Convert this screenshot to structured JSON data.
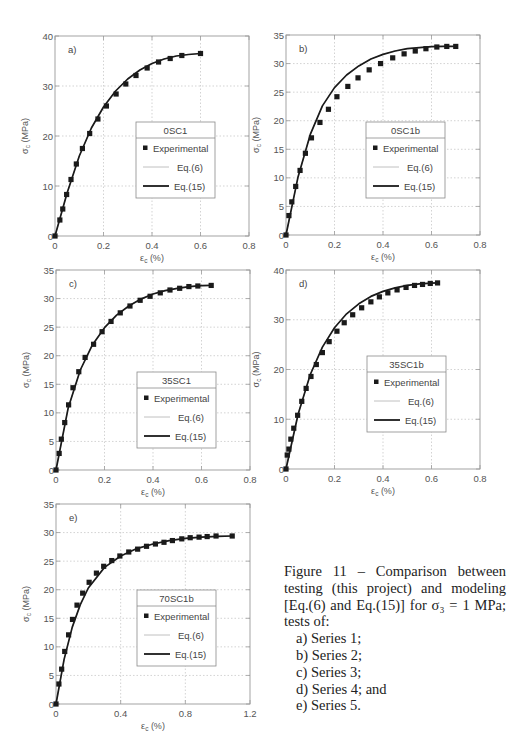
{
  "chart_data": [
    {
      "type": "scatter",
      "panel_label": "a)",
      "legend_title": "0SC1",
      "legend": [
        "Experimental",
        "Eq.(6)",
        "Eq.(15)"
      ],
      "xlabel": "εc (%)",
      "ylabel": "σc (MPa)",
      "xlim": [
        0,
        0.8
      ],
      "ylim": [
        0,
        40
      ],
      "xticks": [
        0,
        0.2,
        0.4,
        0.6,
        0.8
      ],
      "yticks": [
        0,
        10,
        20,
        30,
        40
      ],
      "grid": true,
      "experimental": {
        "x": [
          0,
          0.02,
          0.032,
          0.048,
          0.066,
          0.088,
          0.113,
          0.143,
          0.177,
          0.212,
          0.252,
          0.292,
          0.334,
          0.38,
          0.427,
          0.475,
          0.523,
          0.6
        ],
        "y": [
          0,
          3.2,
          5.4,
          8.3,
          11.3,
          14.4,
          17.5,
          20.5,
          23.4,
          26.0,
          28.4,
          30.4,
          32.1,
          33.6,
          34.8,
          35.5,
          36.1,
          36.5
        ]
      },
      "series": [
        {
          "name": "Eq.(6)",
          "x": [
            0,
            0.05,
            0.1,
            0.15,
            0.2,
            0.25,
            0.3,
            0.35,
            0.4,
            0.45,
            0.5,
            0.55,
            0.6
          ],
          "y": [
            0,
            8.6,
            16.0,
            21.6,
            25.8,
            29.0,
            31.4,
            33.2,
            34.5,
            35.4,
            36.0,
            36.3,
            36.5
          ]
        },
        {
          "name": "Eq.(15)",
          "x": [
            0,
            0.05,
            0.1,
            0.15,
            0.2,
            0.25,
            0.3,
            0.35,
            0.4,
            0.45,
            0.5,
            0.55,
            0.6
          ],
          "y": [
            0,
            8.6,
            16.0,
            21.6,
            25.8,
            29.0,
            31.4,
            33.2,
            34.5,
            35.4,
            36.0,
            36.3,
            36.5
          ]
        }
      ]
    },
    {
      "type": "scatter",
      "panel_label": "b)",
      "legend_title": "0SC1b",
      "legend": [
        "Experimental",
        "Eq.(6)",
        "Eq.(15)"
      ],
      "xlabel": "εc (%)",
      "ylabel": "σc (MPa)",
      "xlim": [
        0,
        0.8
      ],
      "ylim": [
        0,
        35
      ],
      "xticks": [
        0,
        0.2,
        0.4,
        0.6,
        0.8
      ],
      "yticks": [
        0,
        5,
        10,
        15,
        20,
        25,
        30,
        35
      ],
      "grid": true,
      "experimental": {
        "x": [
          0,
          0.012,
          0.024,
          0.04,
          0.058,
          0.08,
          0.105,
          0.14,
          0.175,
          0.21,
          0.255,
          0.297,
          0.343,
          0.39,
          0.44,
          0.487,
          0.533,
          0.577,
          0.622,
          0.663,
          0.7
        ],
        "y": [
          0,
          3.4,
          5.8,
          8.5,
          11.3,
          14.3,
          17.0,
          19.7,
          22.0,
          24.2,
          26.0,
          27.5,
          28.9,
          30.0,
          31.0,
          31.7,
          32.2,
          32.6,
          32.9,
          33.0,
          33.0
        ]
      },
      "series": [
        {
          "name": "Eq.(6)",
          "x": [
            0,
            0.05,
            0.1,
            0.15,
            0.2,
            0.25,
            0.3,
            0.35,
            0.4,
            0.45,
            0.5,
            0.55,
            0.6,
            0.65,
            0.7
          ],
          "y": [
            0,
            10.2,
            17.6,
            22.6,
            25.8,
            28.0,
            29.6,
            30.8,
            31.6,
            32.2,
            32.6,
            32.8,
            32.95,
            33.0,
            33.0
          ]
        },
        {
          "name": "Eq.(15)",
          "x": [
            0,
            0.05,
            0.1,
            0.15,
            0.2,
            0.25,
            0.3,
            0.35,
            0.4,
            0.45,
            0.5,
            0.55,
            0.6,
            0.65,
            0.7
          ],
          "y": [
            0,
            10.2,
            17.6,
            22.6,
            25.8,
            28.0,
            29.6,
            30.8,
            31.6,
            32.2,
            32.6,
            32.8,
            32.95,
            33.0,
            33.0
          ]
        }
      ]
    },
    {
      "type": "scatter",
      "panel_label": "c)",
      "legend_title": "35SC1",
      "legend": [
        "Experimental",
        "Eq.(6)",
        "Eq.(15)"
      ],
      "xlabel": "εc (%)",
      "ylabel": "σc (MPa)",
      "xlim": [
        0,
        0.8
      ],
      "ylim": [
        0,
        35
      ],
      "xticks": [
        0,
        0.2,
        0.4,
        0.6,
        0.8
      ],
      "yticks": [
        0,
        5,
        10,
        15,
        20,
        25,
        30,
        35
      ],
      "grid": true,
      "experimental": {
        "x": [
          0,
          0.013,
          0.022,
          0.036,
          0.052,
          0.07,
          0.094,
          0.12,
          0.155,
          0.19,
          0.227,
          0.265,
          0.305,
          0.347,
          0.388,
          0.43,
          0.47,
          0.51,
          0.548,
          0.585,
          0.64
        ],
        "y": [
          0,
          2.9,
          5.4,
          8.3,
          11.4,
          14.4,
          17.2,
          19.7,
          22.0,
          24.2,
          26.0,
          27.5,
          28.7,
          29.7,
          30.4,
          31.0,
          31.5,
          31.8,
          32.1,
          32.2,
          32.3
        ]
      },
      "series": [
        {
          "name": "Eq.(6)",
          "x": [
            0,
            0.05,
            0.1,
            0.15,
            0.2,
            0.25,
            0.3,
            0.35,
            0.4,
            0.45,
            0.5,
            0.55,
            0.6,
            0.64
          ],
          "y": [
            0,
            10.8,
            17.5,
            21.9,
            24.9,
            27.1,
            28.7,
            29.9,
            30.8,
            31.4,
            31.8,
            32.1,
            32.25,
            32.3
          ]
        },
        {
          "name": "Eq.(15)",
          "x": [
            0,
            0.05,
            0.1,
            0.15,
            0.2,
            0.25,
            0.3,
            0.35,
            0.4,
            0.45,
            0.5,
            0.55,
            0.6,
            0.64
          ],
          "y": [
            0,
            10.8,
            17.5,
            21.9,
            24.9,
            27.1,
            28.7,
            29.9,
            30.8,
            31.4,
            31.8,
            32.1,
            32.25,
            32.3
          ]
        }
      ]
    },
    {
      "type": "scatter",
      "panel_label": "d)",
      "legend_title": "35SC1b",
      "legend": [
        "Experimental",
        "Eq.(6)",
        "Eq.(15)"
      ],
      "xlabel": "εc (%)",
      "ylabel": "σc (MPa)",
      "xlim": [
        0,
        0.8
      ],
      "ylim": [
        0,
        40
      ],
      "xticks": [
        0,
        0.2,
        0.4,
        0.6,
        0.8
      ],
      "yticks": [
        0,
        10,
        20,
        30,
        40
      ],
      "grid": true,
      "experimental": {
        "x": [
          0,
          0.005,
          0.012,
          0.02,
          0.032,
          0.048,
          0.065,
          0.083,
          0.103,
          0.125,
          0.15,
          0.178,
          0.21,
          0.24,
          0.275,
          0.312,
          0.35,
          0.385,
          0.42,
          0.458,
          0.495,
          0.53,
          0.563,
          0.595,
          0.625
        ],
        "y": [
          0,
          2.8,
          4.0,
          6.0,
          8.2,
          10.8,
          13.6,
          16.2,
          18.6,
          21.0,
          23.4,
          25.6,
          27.7,
          29.4,
          31.0,
          32.4,
          33.6,
          34.6,
          35.4,
          36.0,
          36.5,
          36.9,
          37.1,
          37.3,
          37.4
        ]
      },
      "series": [
        {
          "name": "Eq.(6)",
          "x": [
            0,
            0.05,
            0.1,
            0.15,
            0.2,
            0.25,
            0.3,
            0.35,
            0.4,
            0.45,
            0.5,
            0.55,
            0.6,
            0.625
          ],
          "y": [
            0,
            11.0,
            19.0,
            24.5,
            28.4,
            31.2,
            33.2,
            34.7,
            35.7,
            36.4,
            36.9,
            37.2,
            37.35,
            37.4
          ]
        },
        {
          "name": "Eq.(15)",
          "x": [
            0,
            0.05,
            0.1,
            0.15,
            0.2,
            0.25,
            0.3,
            0.35,
            0.4,
            0.45,
            0.5,
            0.55,
            0.6,
            0.625
          ],
          "y": [
            0,
            11.0,
            19.0,
            24.5,
            28.4,
            31.2,
            33.2,
            34.7,
            35.7,
            36.4,
            36.9,
            37.2,
            37.35,
            37.4
          ]
        }
      ]
    },
    {
      "type": "scatter",
      "panel_label": "e)",
      "legend_title": "70SC1b",
      "legend": [
        "Experimental",
        "Eq.(6)",
        "Eq.(15)"
      ],
      "xlabel": "εc (%)",
      "ylabel": "σc (MPa)",
      "xlim": [
        0,
        1.2
      ],
      "ylim": [
        0,
        35
      ],
      "xticks": [
        0,
        0.4,
        0.8,
        1.2
      ],
      "yticks": [
        0,
        5,
        10,
        15,
        20,
        25,
        30,
        35
      ],
      "grid": true,
      "experimental": {
        "x": [
          0,
          0.018,
          0.035,
          0.054,
          0.078,
          0.102,
          0.13,
          0.165,
          0.205,
          0.25,
          0.295,
          0.345,
          0.395,
          0.45,
          0.505,
          0.56,
          0.615,
          0.668,
          0.72,
          0.778,
          0.83,
          0.885,
          0.935,
          0.99,
          1.09
        ],
        "y": [
          0,
          3.5,
          6.1,
          9.2,
          12.1,
          14.8,
          17.3,
          19.4,
          21.3,
          22.9,
          24.1,
          25.1,
          25.9,
          26.6,
          27.1,
          27.6,
          28.0,
          28.3,
          28.6,
          28.9,
          29.1,
          29.2,
          29.3,
          29.4,
          29.4
        ]
      },
      "series": [
        {
          "name": "Eq.(6)",
          "x": [
            0,
            0.05,
            0.1,
            0.15,
            0.2,
            0.3,
            0.4,
            0.5,
            0.6,
            0.7,
            0.8,
            0.9,
            1.0,
            1.09
          ],
          "y": [
            0,
            7.8,
            13.4,
            17.4,
            20.3,
            23.9,
            25.9,
            27.2,
            28.0,
            28.6,
            29.0,
            29.2,
            29.35,
            29.4
          ]
        },
        {
          "name": "Eq.(15)",
          "x": [
            0,
            0.05,
            0.1,
            0.15,
            0.2,
            0.3,
            0.4,
            0.5,
            0.6,
            0.7,
            0.8,
            0.9,
            1.0,
            1.09
          ],
          "y": [
            0,
            7.8,
            13.4,
            17.4,
            20.3,
            23.9,
            25.9,
            27.2,
            28.0,
            28.6,
            29.0,
            29.2,
            29.35,
            29.4
          ]
        }
      ]
    }
  ],
  "caption": {
    "main": "Figure 11 – Comparison between testing (this project) and modeling [Eq.(6) and Eq.(15)] for σ₃ = 1 MPa; tests of:",
    "items": [
      "a) Series 1;",
      "b) Series 2;",
      "c) Series 3;",
      "d) Series 4; and",
      "e) Series 5."
    ]
  }
}
